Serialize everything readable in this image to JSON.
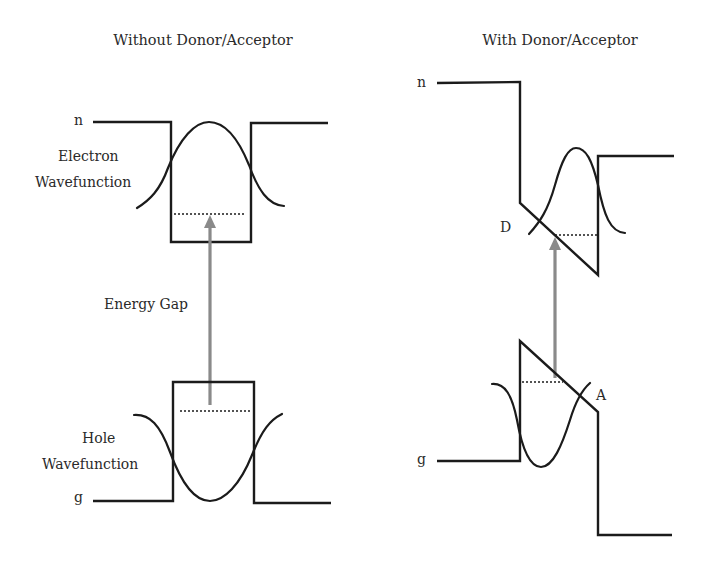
{
  "panels": {
    "left": {
      "title": "Without Donor/Acceptor",
      "conduction_label": "n",
      "valence_label": "g",
      "electron_label_line1": "Electron",
      "electron_label_line2": "Wavefunction",
      "hole_label_line1": "Hole",
      "hole_label_line2": "Wavefunction",
      "gap_label": "Energy Gap"
    },
    "right": {
      "title": "With Donor/Acceptor",
      "conduction_label": "n",
      "valence_label": "g",
      "donor_label": "D",
      "acceptor_label": "A"
    }
  },
  "colors": {
    "line": "#1b1b1b",
    "arrow": "#8a8a8a",
    "text": "#2a2a2a",
    "background": "#ffffff"
  }
}
